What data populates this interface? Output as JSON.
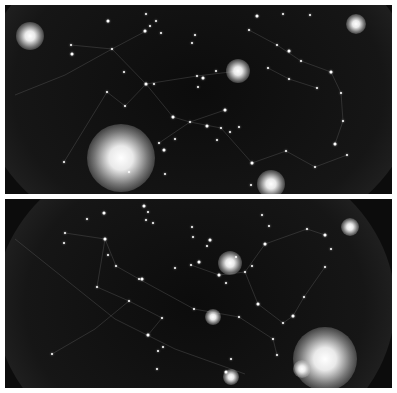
{
  "image": {
    "description": "Two stacked night-sky star map panels with faint constellation lines",
    "colors": {
      "background": "#ffffff",
      "sky": "#0c0c0c",
      "star": "#ffffff",
      "line": "#5a5a5a"
    }
  },
  "panels": [
    {
      "id": "top",
      "glows": [
        {
          "x": 25,
          "y": 31,
          "r": 14
        },
        {
          "x": 116,
          "y": 153,
          "r": 34
        },
        {
          "x": 233,
          "y": 66,
          "r": 12
        },
        {
          "x": 266,
          "y": 179,
          "r": 14
        },
        {
          "x": 351,
          "y": 19,
          "r": 10
        }
      ],
      "stars": [
        [
          103,
          16
        ],
        [
          141,
          9
        ],
        [
          145,
          21
        ],
        [
          151,
          16
        ],
        [
          140,
          26
        ],
        [
          156,
          28
        ],
        [
          66,
          40
        ],
        [
          107,
          44
        ],
        [
          67,
          49
        ],
        [
          187,
          38
        ],
        [
          190,
          30
        ],
        [
          119,
          67
        ],
        [
          141,
          79
        ],
        [
          149,
          79
        ],
        [
          211,
          66
        ],
        [
          192,
          71
        ],
        [
          198,
          73
        ],
        [
          193,
          82
        ],
        [
          120,
          101
        ],
        [
          102,
          87
        ],
        [
          168,
          112
        ],
        [
          185,
          117
        ],
        [
          154,
          138
        ],
        [
          170,
          134
        ],
        [
          159,
          145
        ],
        [
          59,
          157
        ],
        [
          124,
          167
        ],
        [
          160,
          169
        ],
        [
          220,
          105
        ],
        [
          216,
          123
        ],
        [
          225,
          127
        ],
        [
          234,
          122
        ],
        [
          202,
          121
        ],
        [
          212,
          135
        ],
        [
          244,
          25
        ],
        [
          272,
          40
        ],
        [
          284,
          46
        ],
        [
          296,
          56
        ],
        [
          263,
          63
        ],
        [
          284,
          74
        ],
        [
          326,
          67
        ],
        [
          312,
          83
        ],
        [
          336,
          88
        ],
        [
          338,
          116
        ],
        [
          330,
          139
        ],
        [
          342,
          150
        ],
        [
          310,
          162
        ],
        [
          281,
          146
        ],
        [
          247,
          158
        ],
        [
          246,
          180
        ],
        [
          278,
          9
        ],
        [
          305,
          10
        ],
        [
          252,
          11
        ]
      ],
      "lines": [
        [
          [
            66,
            40
          ],
          [
            107,
            44
          ],
          [
            141,
            79
          ],
          [
            192,
            71
          ],
          [
            233,
            66
          ]
        ],
        [
          [
            120,
            101
          ],
          [
            141,
            79
          ],
          [
            168,
            112
          ],
          [
            185,
            117
          ],
          [
            220,
            105
          ]
        ],
        [
          [
            59,
            157
          ],
          [
            102,
            87
          ],
          [
            120,
            101
          ]
        ],
        [
          [
            154,
            138
          ],
          [
            185,
            117
          ],
          [
            216,
            123
          ],
          [
            247,
            158
          ],
          [
            281,
            146
          ],
          [
            310,
            162
          ],
          [
            342,
            150
          ]
        ],
        [
          [
            244,
            25
          ],
          [
            272,
            40
          ],
          [
            296,
            56
          ],
          [
            326,
            67
          ],
          [
            336,
            88
          ],
          [
            338,
            116
          ],
          [
            330,
            139
          ]
        ],
        [
          [
            263,
            63
          ],
          [
            284,
            74
          ],
          [
            312,
            83
          ]
        ],
        [
          [
            10,
            90
          ],
          [
            60,
            70
          ],
          [
            107,
            44
          ],
          [
            141,
            26
          ]
        ]
      ]
    },
    {
      "id": "bottom",
      "glows": [
        {
          "x": 225,
          "y": 64,
          "r": 12
        },
        {
          "x": 320,
          "y": 160,
          "r": 32
        },
        {
          "x": 297,
          "y": 170,
          "r": 9
        },
        {
          "x": 226,
          "y": 178,
          "r": 8
        },
        {
          "x": 345,
          "y": 28,
          "r": 9
        },
        {
          "x": 208,
          "y": 118,
          "r": 8
        }
      ],
      "stars": [
        [
          139,
          7
        ],
        [
          143,
          13
        ],
        [
          141,
          21
        ],
        [
          148,
          24
        ],
        [
          99,
          14
        ],
        [
          82,
          20
        ],
        [
          60,
          34
        ],
        [
          59,
          44
        ],
        [
          100,
          40
        ],
        [
          103,
          56
        ],
        [
          111,
          67
        ],
        [
          134,
          80
        ],
        [
          137,
          80
        ],
        [
          92,
          88
        ],
        [
          124,
          102
        ],
        [
          157,
          119
        ],
        [
          143,
          136
        ],
        [
          158,
          148
        ],
        [
          189,
          110
        ],
        [
          186,
          66
        ],
        [
          194,
          63
        ],
        [
          188,
          38
        ],
        [
          187,
          28
        ],
        [
          202,
          47
        ],
        [
          214,
          76
        ],
        [
          221,
          84
        ],
        [
          240,
          73
        ],
        [
          247,
          67
        ],
        [
          260,
          45
        ],
        [
          264,
          27
        ],
        [
          257,
          16
        ],
        [
          302,
          30
        ],
        [
          320,
          36
        ],
        [
          326,
          50
        ],
        [
          320,
          68
        ],
        [
          299,
          98
        ],
        [
          288,
          117
        ],
        [
          278,
          124
        ],
        [
          268,
          140
        ],
        [
          272,
          156
        ],
        [
          221,
          173
        ],
        [
          152,
          170
        ],
        [
          153,
          152
        ],
        [
          226,
          160
        ],
        [
          253,
          105
        ],
        [
          234,
          118
        ],
        [
          170,
          69
        ],
        [
          231,
          58
        ],
        [
          205,
          41
        ],
        [
          47,
          155
        ]
      ],
      "lines": [
        [
          [
            60,
            34
          ],
          [
            100,
            40
          ],
          [
            111,
            67
          ],
          [
            134,
            80
          ],
          [
            189,
            110
          ]
        ],
        [
          [
            100,
            40
          ],
          [
            92,
            88
          ],
          [
            124,
            102
          ],
          [
            157,
            119
          ],
          [
            143,
            136
          ]
        ],
        [
          [
            186,
            66
          ],
          [
            214,
            76
          ],
          [
            240,
            73
          ],
          [
            260,
            45
          ],
          [
            302,
            30
          ],
          [
            320,
            36
          ]
        ],
        [
          [
            240,
            73
          ],
          [
            253,
            105
          ],
          [
            278,
            124
          ],
          [
            288,
            117
          ],
          [
            299,
            98
          ],
          [
            320,
            68
          ]
        ],
        [
          [
            189,
            110
          ],
          [
            234,
            118
          ],
          [
            268,
            140
          ],
          [
            272,
            156
          ]
        ],
        [
          [
            47,
            155
          ],
          [
            90,
            130
          ],
          [
            124,
            102
          ]
        ],
        [
          [
            10,
            40
          ],
          [
            60,
            80
          ],
          [
            110,
            120
          ],
          [
            170,
            150
          ],
          [
            240,
            175
          ]
        ]
      ]
    }
  ]
}
